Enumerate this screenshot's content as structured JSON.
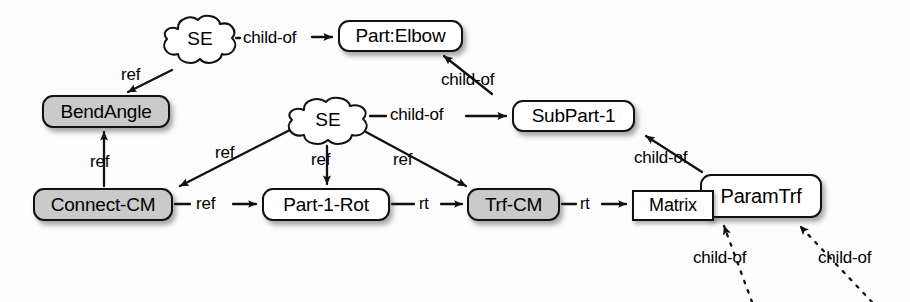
{
  "diagram": {
    "colors": {
      "stroke": "#111111",
      "node_fill_white": "#ffffff",
      "node_fill_gray": "#cacaca",
      "background": "#fdfdfd",
      "text": "#000000"
    },
    "nodes": [
      {
        "id": "se1",
        "label": "SE",
        "shape": "cloud",
        "fill": "white",
        "x": 158,
        "y": 12,
        "w": 84,
        "h": 56
      },
      {
        "id": "part_elbow",
        "label": "Part:Elbow",
        "shape": "rounded-box",
        "fill": "white",
        "x": 338,
        "y": 20,
        "w": 125,
        "h": 32
      },
      {
        "id": "bend_angle",
        "label": "BendAngle",
        "shape": "rounded-box",
        "fill": "gray",
        "x": 42,
        "y": 95,
        "w": 128,
        "h": 33
      },
      {
        "id": "se2",
        "label": "SE",
        "shape": "cloud",
        "fill": "white",
        "x": 282,
        "y": 94,
        "w": 92,
        "h": 54
      },
      {
        "id": "subpart_1",
        "label": "SubPart-1",
        "shape": "rounded-box",
        "fill": "white",
        "x": 512,
        "y": 100,
        "w": 123,
        "h": 32
      },
      {
        "id": "connect_cm",
        "label": "Connect-CM",
        "shape": "rounded-box",
        "fill": "gray",
        "x": 33,
        "y": 188,
        "w": 140,
        "h": 33
      },
      {
        "id": "part_1_rot",
        "label": "Part-1-Rot",
        "shape": "rounded-box",
        "fill": "white",
        "x": 262,
        "y": 188,
        "w": 128,
        "h": 33
      },
      {
        "id": "trf_cm",
        "label": "Trf-CM",
        "shape": "rounded-box",
        "fill": "gray",
        "x": 467,
        "y": 188,
        "w": 93,
        "h": 33
      },
      {
        "id": "matrix",
        "label": "Matrix",
        "shape": "rectangle",
        "fill": "white",
        "x": 632,
        "y": 190,
        "w": 82,
        "h": 31
      },
      {
        "id": "param_trf",
        "label": "ParamTrf",
        "shape": "rounded-box",
        "fill": "white",
        "x": 700,
        "y": 174,
        "w": 122,
        "h": 44
      }
    ],
    "edges": [
      {
        "id": "e1",
        "from": "se1",
        "to": "part_elbow",
        "label": "child-of",
        "style": "solid",
        "label_x": 243,
        "label_y": 28
      },
      {
        "id": "e2",
        "from": "se1",
        "to": "bend_angle",
        "label": "ref",
        "style": "solid",
        "label_x": 121,
        "label_y": 68
      },
      {
        "id": "e3",
        "from": "subpart_1",
        "to": "part_elbow",
        "label": "child-of",
        "style": "solid",
        "label_x": 441,
        "label_y": 70
      },
      {
        "id": "e4",
        "from": "se2",
        "to": "subpart_1",
        "label": "child-of",
        "style": "solid",
        "label_x": 390,
        "label_y": 105
      },
      {
        "id": "e5",
        "from": "se2",
        "to": "connect_cm",
        "label": "ref",
        "style": "solid",
        "label_x": 215,
        "label_y": 144
      },
      {
        "id": "e6",
        "from": "se2",
        "to": "part_1_rot",
        "label": "ref",
        "style": "solid",
        "label_x": 310,
        "label_y": 150
      },
      {
        "id": "e7",
        "from": "se2",
        "to": "trf_cm",
        "label": "ref",
        "style": "solid",
        "label_x": 392,
        "label_y": 150
      },
      {
        "id": "e8",
        "from": "connect_cm",
        "to": "bend_angle",
        "label": "ref",
        "style": "solid",
        "label_x": 90,
        "label_y": 153
      },
      {
        "id": "e9",
        "from": "connect_cm",
        "to": "part_1_rot",
        "label": "ref",
        "style": "solid",
        "label_x": 200,
        "label_y": 194
      },
      {
        "id": "e10",
        "from": "part_1_rot",
        "to": "trf_cm",
        "label": "rt",
        "style": "solid",
        "label_x": 427,
        "label_y": 194
      },
      {
        "id": "e11",
        "from": "trf_cm",
        "to": "matrix",
        "label": "rt",
        "style": "solid",
        "label_x": 588,
        "label_y": 194
      },
      {
        "id": "e12",
        "from": "param_trf",
        "to": "subpart_1",
        "label": "child-of",
        "style": "solid",
        "label_x": 634,
        "label_y": 150
      },
      {
        "id": "e13",
        "from": "offscreen1",
        "to": "param_trf",
        "label": "child-of",
        "style": "dotted",
        "label_x": 693,
        "label_y": 250
      },
      {
        "id": "e14",
        "from": "offscreen2",
        "to": "param_trf",
        "label": "child-of",
        "style": "dotted",
        "label_x": 820,
        "label_y": 250
      }
    ]
  }
}
